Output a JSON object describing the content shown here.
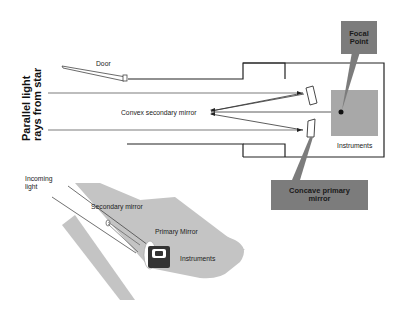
{
  "diagram": {
    "side_label": "Parallel light rays from star",
    "side_label_lines": [
      "Parallel light",
      "rays from star"
    ],
    "labels": {
      "door": "Door",
      "convex_secondary": "Convex secondary mirror",
      "instruments_box": "Instruments",
      "focal_point_line1": "Focal",
      "focal_point_line2": "Point",
      "concave_primary_line1": "Concave primary",
      "concave_primary_line2": "mirror"
    },
    "inset": {
      "incoming_light_line1": "Incoming",
      "incoming_light_line2": "light",
      "secondary_mirror": "Secondary mirror",
      "primary_mirror": "Primary Mirror",
      "instruments": "Instruments"
    },
    "colors": {
      "callout_fill": "#7c7c7c",
      "instruments_fill": "#a8a8a8",
      "inset_body": "#c4c4c4",
      "line": "#222222"
    }
  }
}
